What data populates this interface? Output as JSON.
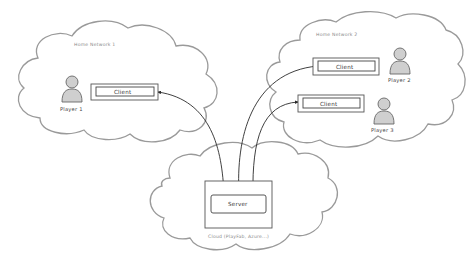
{
  "diagram": {
    "networks": [
      {
        "id": "home1",
        "label": "Home Network 1"
      },
      {
        "id": "home2",
        "label": "Home Network 2"
      },
      {
        "id": "cloud",
        "label": "Cloud (PlayFab, Azure...)"
      }
    ],
    "nodes": {
      "client1": {
        "label": "Client"
      },
      "client2": {
        "label": "Client"
      },
      "client3": {
        "label": "Client"
      },
      "server": {
        "label": "Server"
      }
    },
    "players": [
      {
        "label": "Player 1"
      },
      {
        "label": "Player 2"
      },
      {
        "label": "Player 3"
      }
    ],
    "connections": [
      {
        "from": "server",
        "to": "client1"
      },
      {
        "from": "server",
        "to": "client2"
      },
      {
        "from": "server",
        "to": "client3"
      }
    ],
    "colors": {
      "cloud_stroke": "#9a9a9a",
      "line": "#2a2a2a",
      "person_fill": "#cfcfcf"
    }
  }
}
